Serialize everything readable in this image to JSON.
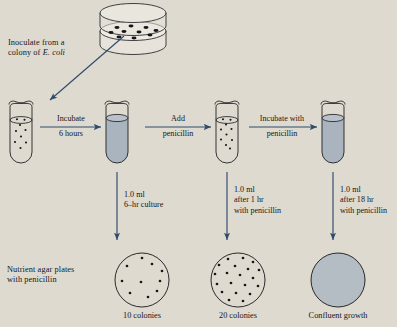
{
  "figure": {
    "title_text": "Penicillin selection experiment with E. coli",
    "background_color": "#dedacf",
    "arrow_color": "#2f4a6d",
    "ink_color": "#16161a",
    "liquid_color": "#aab4bf",
    "dish_fill": "#e7e3da"
  },
  "source_dish": {
    "label_line1": "Inoculate from a",
    "label_line2_pre": "colony of ",
    "label_line2_italic": "E. coli",
    "colony_count": 10
  },
  "steps": [
    {
      "name": "incubate",
      "line1": "Incubate",
      "line2": "6 hours"
    },
    {
      "name": "add-penicillin",
      "line1": "Add",
      "line2": "penicillin"
    },
    {
      "name": "incubate-penicillin",
      "line1": "Incubate with",
      "line2": "penicillin"
    }
  ],
  "tubes": [
    {
      "name": "tube-inoculated",
      "state": "cells-suspended",
      "filled": false,
      "dot_count": 9
    },
    {
      "name": "tube-6hr-culture",
      "state": "turbid-culture",
      "filled": true,
      "dot_count": 0
    },
    {
      "name": "tube-penicillin-added",
      "state": "cells-suspended",
      "filled": false,
      "dot_count": 10
    },
    {
      "name": "tube-after-penicillin",
      "state": "turbid-culture",
      "filled": true,
      "dot_count": 0
    }
  ],
  "samplings": [
    {
      "name": "sample-6hr",
      "lines": [
        "1.0 ml",
        "6–hr culture"
      ]
    },
    {
      "name": "sample-1hr-pen",
      "lines": [
        "1.0 ml",
        "after 1 hr",
        "with penicillin"
      ]
    },
    {
      "name": "sample-18hr-pen",
      "lines": [
        "1.0 ml",
        "after 18 hr",
        "with penicillin"
      ]
    }
  ],
  "plates_label": {
    "line1": "Nutrient agar plates",
    "line2": "with penicillin"
  },
  "plates": [
    {
      "name": "plate-10-colonies",
      "caption": "10 colonies",
      "colonies": 10,
      "confluent": false
    },
    {
      "name": "plate-20-colonies",
      "caption": "20 colonies",
      "colonies": 20,
      "confluent": false
    },
    {
      "name": "plate-confluent",
      "caption": "Confluent growth",
      "colonies": 0,
      "confluent": true
    }
  ]
}
